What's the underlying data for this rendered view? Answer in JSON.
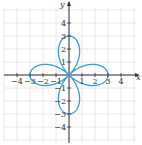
{
  "chart_data": {
    "type": "line",
    "title": "",
    "equation_form": "polar rose curve, 4 petals",
    "xlabel": "x",
    "ylabel": "y",
    "xlim": [
      -5,
      5
    ],
    "ylim": [
      -5,
      5
    ],
    "grid": true,
    "x_ticks": [
      -4,
      -3,
      -2,
      -1,
      1,
      2,
      3,
      4
    ],
    "y_ticks": [
      -4,
      -3,
      -2,
      -1,
      1,
      2,
      3,
      4
    ],
    "x_tick_labels": [
      "−4",
      "−3",
      "−2",
      "−1",
      "1",
      "2",
      "3",
      "4"
    ],
    "y_tick_labels": [
      "−4",
      "−3",
      "−2",
      "−1",
      "1",
      "2",
      "3",
      "4"
    ],
    "series": [
      {
        "name": "rose curve r = 3cos(2θ)",
        "color": "#3a9fd0",
        "petal_tips": [
          [
            3,
            0
          ],
          [
            0,
            3
          ],
          [
            -3,
            0
          ],
          [
            0,
            -3
          ]
        ]
      }
    ]
  },
  "axes": {
    "x_name": "x",
    "y_name": "y"
  },
  "colors": {
    "curve": "#3a9fd0",
    "grid": "#e2e2e2",
    "axis": "#333333"
  }
}
